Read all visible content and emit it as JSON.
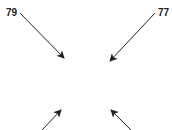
{
  "diagram": {
    "background": "#ffffff",
    "stroke_color": "#222222",
    "labels": [
      {
        "text": "79",
        "x": 6,
        "y": 8
      },
      {
        "text": "77",
        "x": 158,
        "y": 8
      }
    ],
    "arrows": [
      {
        "ref": "79",
        "x1": 20,
        "y1": 13,
        "x2": 64,
        "y2": 58
      },
      {
        "ref": "77",
        "x1": 155,
        "y1": 13,
        "x2": 110,
        "y2": 61
      },
      {
        "ref": "",
        "x1": 42,
        "y1": 130,
        "x2": 61,
        "y2": 110
      },
      {
        "ref": "",
        "x1": 131,
        "y1": 130,
        "x2": 111,
        "y2": 110
      }
    ]
  }
}
